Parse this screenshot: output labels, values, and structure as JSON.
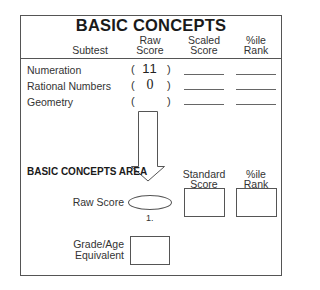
{
  "title": "BASIC CONCEPTS",
  "headers": {
    "subtest": "Subtest",
    "raw_score": [
      "Raw",
      "Score"
    ],
    "scaled_score": [
      "Scaled",
      "Score"
    ],
    "percentile_rank": [
      "%ile",
      "Rank"
    ]
  },
  "rows": [
    {
      "label": "Numeration",
      "raw_open": "(",
      "raw_value": "11",
      "raw_close": ")",
      "scaled": "",
      "percentile": ""
    },
    {
      "label": "Rational Numbers",
      "raw_open": "(",
      "raw_value": "0",
      "raw_close": ")",
      "scaled": "",
      "percentile": ""
    },
    {
      "label": "Geometry",
      "raw_open": "(",
      "raw_value": "",
      "raw_close": ")",
      "scaled": "",
      "percentile": ""
    }
  ],
  "area": {
    "title": "BASIC CONCEPTS AREA",
    "standard_score_label": [
      "Standard",
      "Score"
    ],
    "percentile_rank_label": [
      "%ile",
      "Rank"
    ],
    "raw_score_label": "Raw Score",
    "raw_score_note": "1.",
    "grade_age_label": [
      "Grade/Age",
      "Equivalent"
    ],
    "arrow_icon": "down-arrow-icon"
  }
}
